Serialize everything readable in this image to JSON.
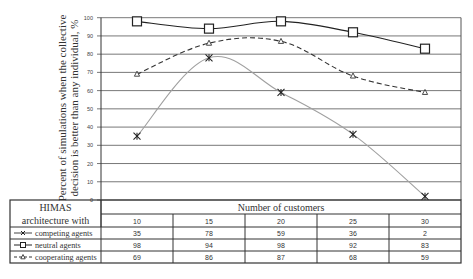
{
  "chart_data": {
    "type": "line",
    "title": "",
    "xlabel": "Number of customers",
    "ylabel": "Percent of simulations when the collective decision is better than any individual, %",
    "ylabel_lines": [
      "Percent of simulations when the collective",
      "decision is better than any individual, %"
    ],
    "categories": [
      "10",
      "15",
      "20",
      "25",
      "30"
    ],
    "ylim": [
      0,
      100
    ],
    "yticks": [
      "0",
      "10",
      "20",
      "30",
      "40",
      "50",
      "60",
      "70",
      "80",
      "90",
      "100"
    ],
    "grid": true,
    "legend_position": "data-table-left",
    "series": [
      {
        "name": "competing agents",
        "values": [
          35,
          78,
          59,
          36,
          2
        ],
        "marker": "x-star",
        "line": "solid",
        "color": "#a0a0a0"
      },
      {
        "name": "neutral agents",
        "values": [
          98,
          94,
          98,
          92,
          83
        ],
        "marker": "square",
        "line": "solid",
        "color": "#222222"
      },
      {
        "name": "cooperating agents",
        "values": [
          69,
          86,
          87,
          68,
          59
        ],
        "marker": "triangle",
        "line": "dashed",
        "color": "#333333"
      }
    ]
  },
  "table": {
    "header_label_line1": "HIMAS",
    "header_label_line2": "architecture with",
    "x_title": "Number of customers",
    "categories": [
      "10",
      "15",
      "20",
      "25",
      "30"
    ],
    "rows": [
      {
        "label": "competing agents",
        "values": [
          "35",
          "78",
          "59",
          "36",
          "2"
        ]
      },
      {
        "label": "neutral agents",
        "values": [
          "98",
          "94",
          "98",
          "92",
          "83"
        ]
      },
      {
        "label": "cooperating agents",
        "values": [
          "69",
          "86",
          "87",
          "68",
          "59"
        ]
      }
    ]
  }
}
